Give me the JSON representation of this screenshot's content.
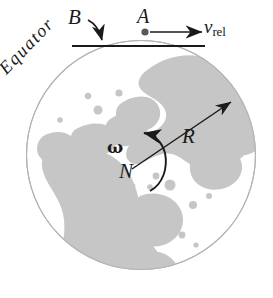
{
  "figure": {
    "name": "earth-rotation-relative-velocity-diagram",
    "width": 273,
    "height": 298,
    "background_color": "#ffffff"
  },
  "globe": {
    "label": "earth-globe",
    "center_x": 141,
    "center_y": 155,
    "radius": 115,
    "outline_color": "#b0b0b0",
    "land_color": "#c6c6c6",
    "ocean_color": "#ffffff",
    "view": "north-polar"
  },
  "labels": {
    "equator": "Equator",
    "point_b": "B",
    "point_a": "A",
    "velocity_symbol": "v",
    "velocity_subscript": "rel",
    "radius_symbol": "R",
    "north_pole": "N",
    "angular_velocity": "ω"
  },
  "annotations": {
    "tangent_line": {
      "name": "equator-tangent-line",
      "x1": 72,
      "y1": 46,
      "x2": 205,
      "y2": 46,
      "color": "#1a1a1a"
    },
    "b_arrow": {
      "name": "b-pointer-arrow",
      "description": "curved arrow from label B down to the tangent line",
      "color": "#1a1a1a"
    },
    "a_dot": {
      "name": "point-a-marker",
      "x": 145,
      "y": 32,
      "radius": 3.6,
      "color": "#555555"
    },
    "vrel_arrow": {
      "name": "relative-velocity-arrow",
      "x1": 150,
      "y1": 32,
      "x2": 203,
      "y2": 32,
      "color": "#1a1a1a"
    },
    "r_arrow": {
      "name": "radius-vector-arrow",
      "x1": 133,
      "y1": 168,
      "x2": 232,
      "y2": 103,
      "color": "#1a1a1a"
    },
    "omega_arc": {
      "name": "angular-velocity-arc-arrow",
      "description": "counterclockwise curved arrow around the north pole",
      "color": "#1a1a1a"
    }
  },
  "colors": {
    "ink": "#1a1a1a",
    "land": "#c6c6c6",
    "outline": "#b0b0b0"
  }
}
